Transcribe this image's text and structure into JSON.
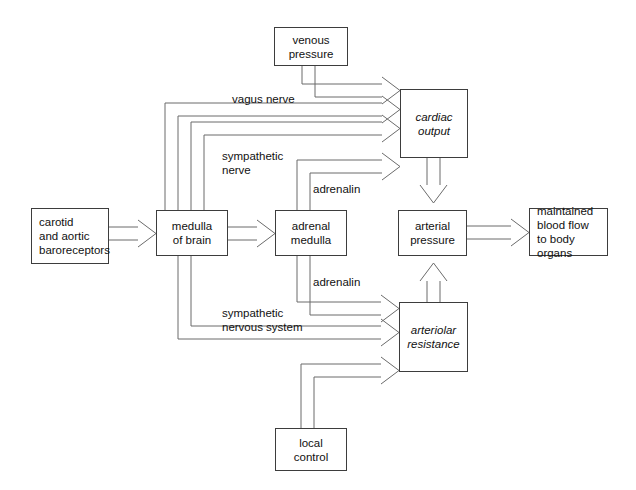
{
  "diagram": {
    "type": "flow-diagram",
    "canvas": {
      "width": 636,
      "height": 490,
      "background": "#ffffff"
    },
    "line_color": "#6b6b6b",
    "box_border_color": "#3d3d3d",
    "text_color": "#111111",
    "nodes": [
      {
        "id": "venous-pressure",
        "label": "venous\npressure",
        "style": "regular",
        "x": 274,
        "y": 27,
        "w": 74,
        "h": 39
      },
      {
        "id": "carotid-baroreceptors",
        "label": "carotid\nand aortic\nbaroreceptors",
        "style": "regular",
        "x": 31,
        "y": 208,
        "w": 78,
        "h": 56
      },
      {
        "id": "medulla-of-brain",
        "label": "medulla\nof brain",
        "style": "regular",
        "x": 156,
        "y": 210,
        "w": 72,
        "h": 46
      },
      {
        "id": "adrenal-medulla",
        "label": "adrenal\nmedulla",
        "style": "regular",
        "x": 275,
        "y": 210,
        "w": 72,
        "h": 46
      },
      {
        "id": "cardiac-output",
        "label": "cardiac\noutput",
        "style": "italic",
        "x": 400,
        "y": 89,
        "w": 68,
        "h": 69
      },
      {
        "id": "arterial-pressure",
        "label": "arterial\npressure",
        "style": "regular",
        "x": 398,
        "y": 210,
        "w": 69,
        "h": 46
      },
      {
        "id": "arteriolar-resistance",
        "label": "arteriolar\nresistance",
        "style": "italic",
        "x": 399,
        "y": 302,
        "w": 69,
        "h": 70
      },
      {
        "id": "maintained-blood-flow",
        "label": "maintained\nblood flow\nto body organs",
        "style": "regular",
        "x": 529,
        "y": 208,
        "w": 79,
        "h": 48
      },
      {
        "id": "local-control",
        "label": "local\ncontrol",
        "style": "regular",
        "x": 275,
        "y": 428,
        "w": 72,
        "h": 43
      }
    ],
    "edge_labels": [
      {
        "id": "vagus-nerve",
        "text": "vagus nerve",
        "x": 232,
        "y": 92
      },
      {
        "id": "sympathetic-nerve",
        "text": "sympathetic\nnerve",
        "x": 222,
        "y": 149
      },
      {
        "id": "adrenalin-upper",
        "text": "adrenalin",
        "x": 313,
        "y": 182
      },
      {
        "id": "adrenalin-lower",
        "text": "adrenalin",
        "x": 313,
        "y": 275
      },
      {
        "id": "sympathetic-nervous-system",
        "text": "sympathetic\nnervous system",
        "x": 222,
        "y": 306
      }
    ],
    "edges": [
      {
        "id": "venous-pressure-to-cardiac-output",
        "from": "venous-pressure",
        "to": "cardiac-output",
        "label": ""
      },
      {
        "id": "vagus-nerve-medulla-to-cardiac-output",
        "from": "medulla-of-brain",
        "to": "cardiac-output",
        "label": "vagus nerve"
      },
      {
        "id": "medulla-to-cardiac-output-2",
        "from": "medulla-of-brain",
        "to": "cardiac-output",
        "label": ""
      },
      {
        "id": "sympathetic-nerve-medulla-to-cardiac-output",
        "from": "medulla-of-brain",
        "to": "cardiac-output",
        "label": "sympathetic nerve"
      },
      {
        "id": "adrenalin-to-cardiac-output",
        "from": "adrenal-medulla",
        "to": "cardiac-output",
        "label": "adrenalin"
      },
      {
        "id": "baroreceptors-to-medulla",
        "from": "carotid-baroreceptors",
        "to": "medulla-of-brain",
        "label": ""
      },
      {
        "id": "medulla-to-adrenal-medulla",
        "from": "medulla-of-brain",
        "to": "adrenal-medulla",
        "label": ""
      },
      {
        "id": "cardiac-output-to-arterial-pressure",
        "from": "cardiac-output",
        "to": "arterial-pressure",
        "label": ""
      },
      {
        "id": "arterial-pressure-to-blood-flow",
        "from": "arterial-pressure",
        "to": "maintained-blood-flow",
        "label": ""
      },
      {
        "id": "arteriolar-resistance-to-arterial-pressure",
        "from": "arteriolar-resistance",
        "to": "arterial-pressure",
        "label": ""
      },
      {
        "id": "adrenalin-to-arteriolar-resistance",
        "from": "adrenal-medulla",
        "to": "arteriolar-resistance",
        "label": "adrenalin"
      },
      {
        "id": "sympathetic-nervous-system-to-arteriolar-resistance",
        "from": "medulla-of-brain",
        "to": "arteriolar-resistance",
        "label": "sympathetic nervous system"
      },
      {
        "id": "medulla-to-arteriolar-resistance-2",
        "from": "medulla-of-brain",
        "to": "arteriolar-resistance",
        "label": ""
      },
      {
        "id": "local-control-to-arteriolar-resistance",
        "from": "local-control",
        "to": "arteriolar-resistance",
        "label": ""
      }
    ]
  }
}
